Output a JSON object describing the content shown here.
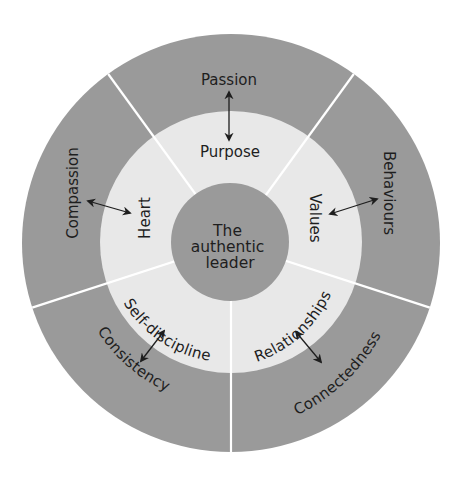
{
  "diagram": {
    "colors": {
      "outer_ring": "#9a9a9a",
      "inner_ring": "#e8e8e8",
      "center": "#9a9a9a",
      "divider": "#ffffff",
      "text": "#1e1e1e"
    },
    "center": {
      "lines": [
        "The",
        "authentic",
        "leader"
      ]
    },
    "segments": [
      {
        "inner": "Purpose",
        "outer": "Passion"
      },
      {
        "inner": "Values",
        "outer": "Behaviours"
      },
      {
        "inner": "Relationships",
        "outer": "Connectedness"
      },
      {
        "inner": "Self-discipline",
        "outer": "Consistency"
      },
      {
        "inner": "Heart",
        "outer": "Compassion"
      }
    ]
  }
}
